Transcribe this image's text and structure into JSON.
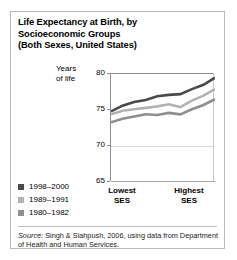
{
  "figure": {
    "title_lines": [
      "Life Expectancy at Birth, by",
      "Socioeconomic Groups",
      "(Both Sexes, United States)"
    ],
    "source_prefix": "Source:",
    "source_text": " Singh & Siahpush, 2006, using data from Department of Health and Human Services.",
    "border_color": "#b9b9b9"
  },
  "chart_data": {
    "type": "line",
    "title": "Life Expectancy at Birth, by Socioeconomic Groups (Both Sexes, United States)",
    "xlabel": "",
    "ylabel": "Years of life",
    "ylabel_lines": [
      "Years",
      "of life"
    ],
    "ylim": [
      65,
      80
    ],
    "yticks": [
      65,
      70,
      75,
      80
    ],
    "ytick_labels": [
      "65",
      "70",
      "75",
      "80"
    ],
    "grid": true,
    "grid_axis": "y",
    "legend_position": "lower-left-outside",
    "x": [
      1,
      2,
      3,
      4,
      5,
      6,
      7,
      8,
      9,
      10
    ],
    "xtick_labels": [
      "Lowest SES",
      "Highest SES"
    ],
    "xcat_left": [
      "Lowest",
      "SES"
    ],
    "xcat_right": [
      "Highest",
      "SES"
    ],
    "series": [
      {
        "name": "1998-2000",
        "color": "#4a4a4a",
        "values": [
          74.8,
          75.6,
          76.1,
          76.4,
          76.9,
          77.1,
          77.2,
          77.9,
          78.5,
          79.5
        ]
      },
      {
        "name": "1989-1991",
        "color": "#b2b2b2",
        "values": [
          74.4,
          74.9,
          75.1,
          75.3,
          75.5,
          75.8,
          75.4,
          76.3,
          77.0,
          77.9
        ]
      },
      {
        "name": "1980-1982",
        "color": "#8f8f8f",
        "values": [
          73.3,
          73.8,
          74.1,
          74.4,
          74.3,
          74.6,
          74.4,
          75.1,
          75.7,
          76.5
        ]
      }
    ]
  },
  "legend": {
    "items": [
      {
        "label": "1998–2000",
        "color": "#4a4a4a"
      },
      {
        "label": "1989–1991",
        "color": "#b2b2b2"
      },
      {
        "label": "1980–1982",
        "color": "#8f8f8f"
      }
    ]
  }
}
